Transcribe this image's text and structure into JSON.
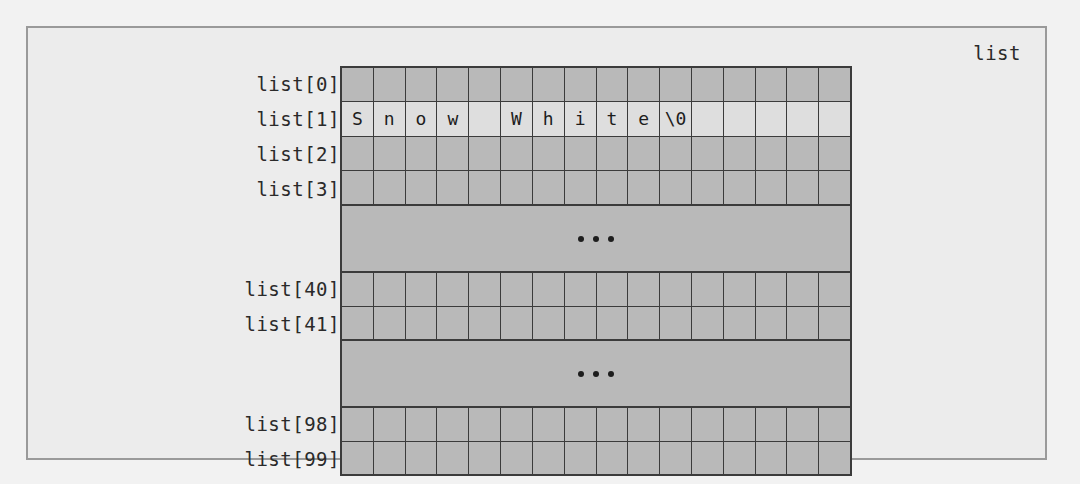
{
  "figure": {
    "array_name": "list",
    "columns": 16,
    "colors": {
      "page_background": "#f2f2f2",
      "figure_background": "#ececec",
      "cell_fill": "#b9b9b9",
      "string_row_fill": "#dedede",
      "grid_line": "#3b3b3b",
      "frame_border": "#9a9a9a",
      "text": "#1d1d1d"
    },
    "blocks": [
      {
        "id": "top-block",
        "rows": [
          {
            "label": "list[0]",
            "cells": [
              "",
              "",
              "",
              "",
              "",
              "",
              "",
              "",
              "",
              "",
              "",
              "",
              "",
              "",
              "",
              ""
            ],
            "highlighted": false
          },
          {
            "label": "list[1]",
            "cells": [
              "S",
              "n",
              "o",
              "w",
              " ",
              "W",
              "h",
              "i",
              "t",
              "e",
              "\\0",
              "",
              "",
              "",
              "",
              ""
            ],
            "highlighted": true
          },
          {
            "label": "list[2]",
            "cells": [
              "",
              "",
              "",
              "",
              "",
              "",
              "",
              "",
              "",
              "",
              "",
              "",
              "",
              "",
              "",
              ""
            ],
            "highlighted": false
          },
          {
            "label": "list[3]",
            "cells": [
              "",
              "",
              "",
              "",
              "",
              "",
              "",
              "",
              "",
              "",
              "",
              "",
              "",
              "",
              "",
              ""
            ],
            "highlighted": false
          }
        ]
      },
      {
        "id": "ellipsis-block-1",
        "ellipsis": "..."
      },
      {
        "id": "middle-block",
        "rows": [
          {
            "label": "list[40]",
            "cells": [
              "",
              "",
              "",
              "",
              "",
              "",
              "",
              "",
              "",
              "",
              "",
              "",
              "",
              "",
              "",
              ""
            ],
            "highlighted": false
          },
          {
            "label": "list[41]",
            "cells": [
              "",
              "",
              "",
              "",
              "",
              "",
              "",
              "",
              "",
              "",
              "",
              "",
              "",
              "",
              "",
              ""
            ],
            "highlighted": false
          }
        ]
      },
      {
        "id": "ellipsis-block-2",
        "ellipsis": "..."
      },
      {
        "id": "bottom-block",
        "rows": [
          {
            "label": "list[98]",
            "cells": [
              "",
              "",
              "",
              "",
              "",
              "",
              "",
              "",
              "",
              "",
              "",
              "",
              "",
              "",
              "",
              ""
            ],
            "highlighted": false
          },
          {
            "label": "list[99]",
            "cells": [
              "",
              "",
              "",
              "",
              "",
              "",
              "",
              "",
              "",
              "",
              "",
              "",
              "",
              "",
              "",
              ""
            ],
            "highlighted": false
          }
        ]
      }
    ],
    "string_value": "Snow White\\0"
  }
}
